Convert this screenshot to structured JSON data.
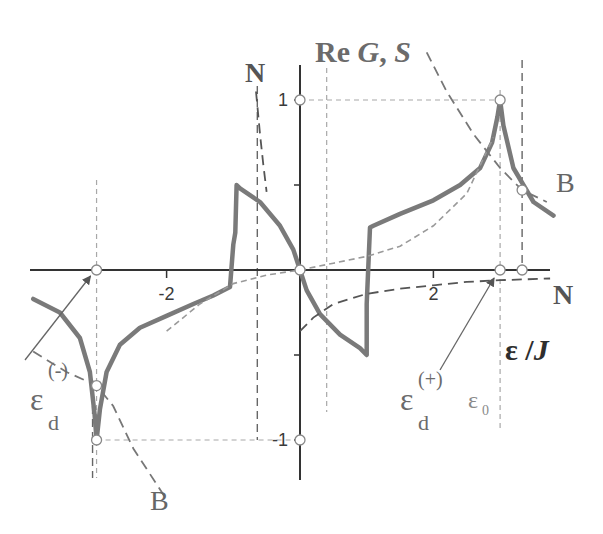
{
  "chart_data": {
    "type": "line",
    "title": "",
    "axis_title_y": {
      "prefix": "Re ",
      "g": "G",
      "sep": ", ",
      "s": "S"
    },
    "axis_title_x": {
      "eps": "ε",
      "sep": " /",
      "j": "J"
    },
    "xlim": [
      -4.05,
      3.9
    ],
    "ylim": [
      -1.22,
      1.55
    ],
    "x_ticks": [
      {
        "value": -2,
        "label": "-2"
      },
      {
        "value": 2,
        "label": "2"
      }
    ],
    "y_ticks": [
      {
        "value": 1,
        "label": "1"
      },
      {
        "value": 0.5,
        "label": ""
      },
      {
        "value": -0.5,
        "label": ""
      },
      {
        "value": -1,
        "label": "-1"
      }
    ],
    "grid": false,
    "special_points": {
      "eps_d_minus": -3.05,
      "eps_d_plus": 3.0,
      "eps_0": 3.33,
      "vline_left_inner": -0.64,
      "vline_right_inner": 0.4,
      "jump_left": -1.0,
      "jump_right": 1.0
    },
    "series": [
      {
        "name": "Re G (solid gray)",
        "style": "solid",
        "color": "#7a7a7a",
        "points": [
          [
            -4.0,
            -0.17
          ],
          [
            -3.6,
            -0.25
          ],
          [
            -3.3,
            -0.4
          ],
          [
            -3.15,
            -0.6
          ],
          [
            -3.08,
            -0.85
          ],
          [
            -3.05,
            -1.0
          ],
          [
            -3.0,
            -0.82
          ],
          [
            -2.9,
            -0.6
          ],
          [
            -2.7,
            -0.44
          ],
          [
            -2.4,
            -0.34
          ],
          [
            -2.0,
            -0.27
          ],
          [
            -1.6,
            -0.2
          ],
          [
            -1.3,
            -0.15
          ],
          [
            -1.05,
            -0.1
          ],
          [
            -1.0,
            0.15
          ],
          [
            -0.97,
            0.22
          ],
          [
            -0.95,
            0.5
          ],
          [
            -0.9,
            0.48
          ],
          [
            -0.6,
            0.4
          ],
          [
            -0.3,
            0.26
          ],
          [
            -0.1,
            0.12
          ],
          [
            0.0,
            0.0
          ],
          [
            0.1,
            -0.12
          ],
          [
            0.3,
            -0.26
          ],
          [
            0.6,
            -0.38
          ],
          [
            0.9,
            -0.46
          ],
          [
            1.0,
            -0.5
          ],
          [
            1.0,
            -0.2
          ],
          [
            1.05,
            0.25
          ],
          [
            1.1,
            0.26
          ],
          [
            1.5,
            0.33
          ],
          [
            2.0,
            0.41
          ],
          [
            2.4,
            0.5
          ],
          [
            2.7,
            0.6
          ],
          [
            2.88,
            0.75
          ],
          [
            2.96,
            0.9
          ],
          [
            3.0,
            1.0
          ],
          [
            3.05,
            0.85
          ],
          [
            3.2,
            0.6
          ],
          [
            3.5,
            0.4
          ],
          [
            3.8,
            0.32
          ]
        ]
      },
      {
        "name": "S (light dashed)",
        "style": "dashed",
        "color": "#9a9a9a",
        "points": [
          [
            -2.0,
            -0.36
          ],
          [
            -1.5,
            -0.2
          ],
          [
            -1.0,
            -0.08
          ],
          [
            -0.5,
            -0.03
          ],
          [
            0.0,
            0.0
          ],
          [
            0.5,
            0.04
          ],
          [
            1.0,
            0.08
          ],
          [
            1.5,
            0.14
          ],
          [
            2.0,
            0.26
          ],
          [
            2.5,
            0.45
          ],
          [
            2.9,
            0.78
          ]
        ]
      },
      {
        "name": "N branch left (dark dashed)",
        "style": "dashed",
        "color": "#555555",
        "points": [
          [
            -0.66,
            1.05
          ],
          [
            -0.6,
            0.8
          ],
          [
            -0.55,
            0.62
          ],
          [
            -0.5,
            0.46
          ]
        ]
      },
      {
        "name": "N branch right (dark dashed)",
        "style": "dashed",
        "color": "#555555",
        "points": [
          [
            0.0,
            -0.36
          ],
          [
            0.2,
            -0.28
          ],
          [
            0.5,
            -0.2
          ],
          [
            1.0,
            -0.14
          ],
          [
            1.5,
            -0.11
          ],
          [
            2.0,
            -0.09
          ],
          [
            2.5,
            -0.07
          ],
          [
            3.0,
            -0.06
          ],
          [
            3.75,
            -0.05
          ]
        ]
      },
      {
        "name": "B branch right (dashed)",
        "style": "dashed",
        "color": "#777777",
        "points": [
          [
            1.9,
            1.28
          ],
          [
            2.2,
            1.05
          ],
          [
            2.6,
            0.8
          ],
          [
            3.0,
            0.6
          ],
          [
            3.33,
            0.47
          ],
          [
            3.7,
            0.4
          ]
        ]
      },
      {
        "name": "B branch left (dashed)",
        "style": "dashed",
        "color": "#777777",
        "points": [
          [
            -4.0,
            -0.48
          ],
          [
            -3.5,
            -0.6
          ],
          [
            -3.05,
            -0.68
          ],
          [
            -2.8,
            -0.8
          ],
          [
            -2.5,
            -1.05
          ],
          [
            -2.0,
            -1.35
          ]
        ]
      }
    ],
    "markers": [
      {
        "name": "origin",
        "x": 0,
        "y": 0
      },
      {
        "name": "eps-d-minus-axis",
        "x": -3.05,
        "y": 0
      },
      {
        "name": "eps-d-plus-axis",
        "x": 3.0,
        "y": 0
      },
      {
        "name": "eps-0-axis",
        "x": 3.33,
        "y": 0
      },
      {
        "name": "y-one",
        "x": 0,
        "y": 1
      },
      {
        "name": "y-minus-one",
        "x": 0,
        "y": -1
      },
      {
        "name": "peak-top",
        "x": 3.0,
        "y": 1
      },
      {
        "name": "peak-bottom",
        "x": -3.05,
        "y": -1
      },
      {
        "name": "b-crossing-right",
        "x": 3.33,
        "y": 0.47
      },
      {
        "name": "b-crossing-left",
        "x": -3.05,
        "y": -0.68
      }
    ],
    "annotations": {
      "N_top": "N",
      "N_right": "N",
      "B_right": "B",
      "B_bottom": "B",
      "eps_d_plus": {
        "base": "ε",
        "sub": "d",
        "sup": "(+)"
      },
      "eps_d_minus": {
        "base": "ε",
        "sub": "d",
        "sup": "(-)"
      },
      "eps_0": {
        "base": "ε",
        "sub": "0"
      }
    }
  }
}
